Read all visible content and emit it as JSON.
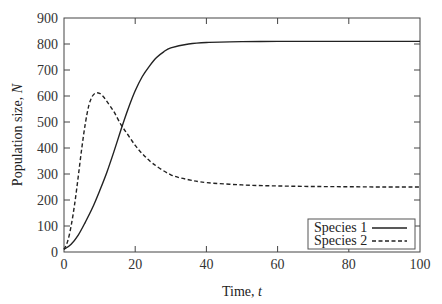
{
  "chart_data": {
    "type": "line",
    "title": "",
    "xlabel": "Time, t",
    "xlabel_main": "Time, ",
    "xlabel_var": "t",
    "ylabel": "Population size, N",
    "ylabel_main": "Population size, ",
    "ylabel_var": "N",
    "xlim": [
      0,
      100
    ],
    "ylim": [
      0,
      900
    ],
    "xticks": [
      0,
      20,
      40,
      60,
      80,
      100
    ],
    "yticks": [
      0,
      100,
      200,
      300,
      400,
      500,
      600,
      700,
      800,
      900
    ],
    "grid": false,
    "legend_position": "lower right",
    "series": [
      {
        "name": "Species 1",
        "style": "solid",
        "x": [
          0,
          2,
          4,
          6,
          8,
          10,
          12,
          14,
          16,
          18,
          20,
          22,
          24,
          26,
          28,
          30,
          35,
          40,
          50,
          60,
          70,
          80,
          90,
          100
        ],
        "values": [
          10,
          30,
          65,
          115,
          170,
          235,
          305,
          385,
          470,
          550,
          620,
          675,
          715,
          748,
          770,
          785,
          800,
          806,
          809,
          810,
          810,
          810,
          810,
          810
        ]
      },
      {
        "name": "Species 2",
        "style": "dashed",
        "x": [
          0,
          1,
          2,
          3,
          4,
          5,
          6,
          7,
          8,
          9,
          10,
          11,
          12,
          14,
          16,
          18,
          20,
          22,
          25,
          30,
          35,
          40,
          50,
          60,
          70,
          80,
          90,
          100
        ],
        "values": [
          10,
          40,
          100,
          185,
          290,
          400,
          495,
          565,
          600,
          612,
          610,
          598,
          580,
          540,
          490,
          450,
          410,
          378,
          340,
          297,
          278,
          267,
          258,
          254,
          252,
          251,
          250,
          250
        ]
      }
    ]
  }
}
